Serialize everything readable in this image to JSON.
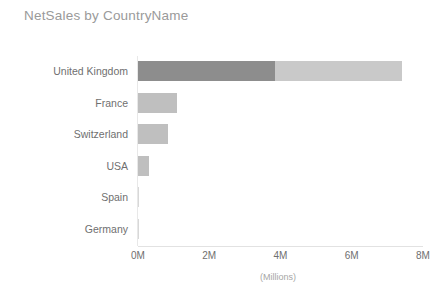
{
  "chart_data": {
    "type": "bar",
    "orientation": "horizontal",
    "title": "NetSales by CountryName",
    "xlabel": "(Millions)",
    "ylabel": "",
    "categories": [
      "United Kingdom",
      "France",
      "Switzerland",
      "USA",
      "Spain",
      "Germany"
    ],
    "values": [
      7.4,
      1.1,
      0.85,
      0.3,
      0.03,
      0.02
    ],
    "series": [
      {
        "name": "NetSales",
        "values": [
          7.4,
          1.1,
          0.85,
          0.3,
          0.03,
          0.02
        ]
      }
    ],
    "segmented_bars": {
      "United Kingdom": {
        "primary": 3.85,
        "secondary_end": 7.4
      }
    },
    "xlim": [
      0,
      8
    ],
    "x_tick_values": [
      0,
      2,
      4,
      6,
      8
    ],
    "x_tick_labels": [
      "0M",
      "2M",
      "4M",
      "6M",
      "8M"
    ],
    "grid": false,
    "legend": null,
    "colors": {
      "bar_primary": "#8d8d8d",
      "bar_secondary": "#c9c9c9",
      "bar_default": "#bfbfbf",
      "title_text": "#9a9a9a",
      "axis_text": "#6f6f6f",
      "unit_text": "#a6a6a6",
      "axis_line": "#e2e2e2",
      "background": "#ffffff"
    }
  }
}
